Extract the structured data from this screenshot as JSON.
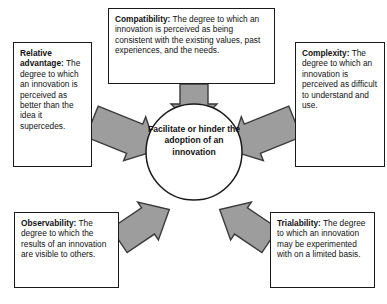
{
  "diagram": {
    "center": {
      "label": "Facilitate or hinder the adoption of an innovation",
      "shape": "circle",
      "fill": "#ffffff",
      "stroke": "#1a1a1a"
    },
    "style": {
      "arrow_fill": "#9d9d9d",
      "arrow_stroke": "#3a3a3a",
      "box_border": "#1a1a1a",
      "box_fill": "#ffffff",
      "text_color": "#111111"
    },
    "attributes": [
      {
        "id": "compatibility",
        "term": "Compatibility:",
        "description": " The degree to which an innovation is perceived as being consistent with the existing values, past experiences, and the needs.",
        "position": "top",
        "arrow_direction": "down"
      },
      {
        "id": "relative-advantage",
        "term": "Relative advantage:",
        "description": " The degree to which an innovation is perceived as better than the idea it supercedes.",
        "position": "left",
        "arrow_direction": "down-right"
      },
      {
        "id": "complexity",
        "term": "Complexity:",
        "description": " The degree to which an innovation is perceived as difficult to understand and use.",
        "position": "right",
        "arrow_direction": "down-left"
      },
      {
        "id": "observability",
        "term": "Observability:",
        "description": " The degree to which the results of an innovation are visible to others.",
        "position": "bottom-left",
        "arrow_direction": "up-right"
      },
      {
        "id": "trialability",
        "term": "Trialability:",
        "description": " The degree to which an innovation may be experimented with on a limited basis.",
        "position": "bottom-right",
        "arrow_direction": "up-left"
      }
    ]
  }
}
